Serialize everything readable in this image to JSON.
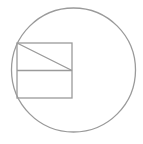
{
  "diagram": {
    "stroke_color": "#9a9a9a",
    "stroke_width": 1.3,
    "circle": {
      "cx": 73.5,
      "cy": 70,
      "r": 62
    },
    "rectangle": {
      "x": 17,
      "y": 43,
      "width": 55,
      "height": 55
    },
    "midline": {
      "x1": 17,
      "y1": 70.5,
      "x2": 72,
      "y2": 70.5
    },
    "diagonal": {
      "x1": 17,
      "y1": 43,
      "x2": 72,
      "y2": 70.5
    }
  }
}
